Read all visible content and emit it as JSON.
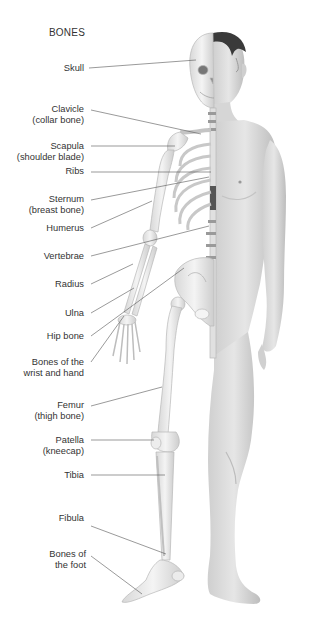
{
  "diagram": {
    "title": "BONES",
    "labels": [
      {
        "id": "skull",
        "line1": "Skull",
        "line2": ""
      },
      {
        "id": "clavicle",
        "line1": "Clavicle",
        "line2": "(collar bone)"
      },
      {
        "id": "scapula",
        "line1": "Scapula",
        "line2": "(shoulder blade)"
      },
      {
        "id": "ribs",
        "line1": "Ribs",
        "line2": ""
      },
      {
        "id": "sternum",
        "line1": "Sternum",
        "line2": "(breast bone)"
      },
      {
        "id": "humerus",
        "line1": "Humerus",
        "line2": ""
      },
      {
        "id": "vertebrae",
        "line1": "Vertebrae",
        "line2": ""
      },
      {
        "id": "radius",
        "line1": "Radius",
        "line2": ""
      },
      {
        "id": "ulna",
        "line1": "Ulna",
        "line2": ""
      },
      {
        "id": "hip-bone",
        "line1": "Hip bone",
        "line2": ""
      },
      {
        "id": "wrist-hand",
        "line1": "Bones of the",
        "line2": "wrist and hand"
      },
      {
        "id": "femur",
        "line1": "Femur",
        "line2": "(thigh bone)"
      },
      {
        "id": "patella",
        "line1": "Patella",
        "line2": "(kneecap)"
      },
      {
        "id": "tibia",
        "line1": "Tibia",
        "line2": ""
      },
      {
        "id": "fibula",
        "line1": "Fibula",
        "line2": ""
      },
      {
        "id": "foot",
        "line1": "Bones of",
        "line2": "the foot"
      }
    ],
    "colors": {
      "background": "#ffffff",
      "text": "#333333",
      "leader_line": "#555555",
      "bone": "#ececec",
      "bone_shade": "#c9c9c9",
      "skin": "#dcdcdc",
      "skin_shade": "#b5b5b5",
      "hair": "#3a3a3a"
    }
  }
}
